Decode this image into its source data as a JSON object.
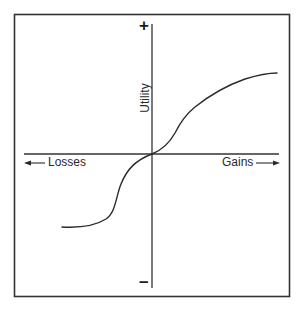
{
  "figure": {
    "title": "",
    "axes": {
      "y_label": "Utility",
      "y_positive_sign": "+",
      "y_negative_sign": "–",
      "x_negative_label": "Losses",
      "x_positive_label": "Gains"
    },
    "colors": {
      "line": "#2a2a2a",
      "frame": "#333333",
      "background": "#ffffff"
    },
    "curve": {
      "description": "S-shaped value function: concave for gains, convex and steeper for losses",
      "gains_branch": [
        [
          0,
          0
        ],
        [
          0.2,
          0.16
        ],
        [
          0.27,
          0.3
        ],
        [
          0.47,
          0.47
        ],
        [
          0.72,
          0.6
        ],
        [
          1.0,
          0.65
        ]
      ],
      "losses_branch": [
        [
          0,
          0
        ],
        [
          -0.1,
          -0.05
        ],
        [
          -0.18,
          -0.14
        ],
        [
          -0.24,
          -0.33
        ],
        [
          -0.3,
          -0.5
        ],
        [
          -0.38,
          -0.59
        ],
        [
          -0.53,
          -0.64
        ],
        [
          -0.71,
          -0.65
        ]
      ]
    }
  }
}
